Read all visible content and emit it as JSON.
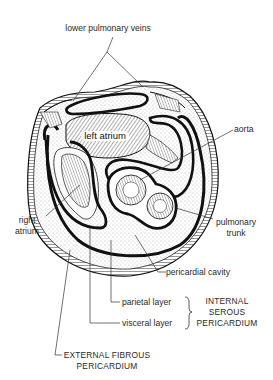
{
  "figure": {
    "type": "anatomical cross-section diagram"
  },
  "labels": {
    "lower_pulmonary_veins": "lower pulmonary veins",
    "left_atrium": "left atrium",
    "aorta": "aorta",
    "right_atrium_line1": "right",
    "right_atrium_line2": "atrium",
    "pulmonary_trunk_line1": "pulmonary",
    "pulmonary_trunk_line2": "trunk",
    "pericardial_cavity": "pericardial cavity",
    "parietal_layer": "parietal layer",
    "visceral_layer": "visceral layer",
    "internal_serous_line1": "INTERNAL",
    "internal_serous_line2": "SEROUS",
    "internal_serous_line3": "PERICARDIUM",
    "external_fibrous_line1": "EXTERNAL FIBROUS",
    "external_fibrous_line2": "PERICARDIUM"
  },
  "colors": {
    "ink": "#111111",
    "label": "#2a2a2a",
    "background": "#ffffff",
    "stipple": "#8a8a8a"
  }
}
